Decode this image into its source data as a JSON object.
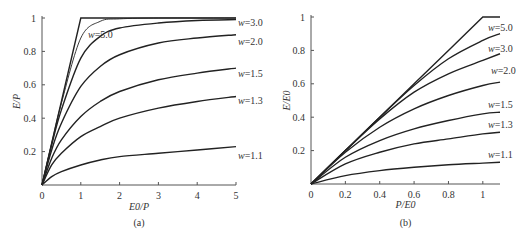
{
  "chart_data": [
    {
      "type": "line",
      "panel": "(a)",
      "xlabel": "E0/P",
      "ylabel": "E/P",
      "xlim": [
        0,
        5
      ],
      "ylim": [
        0,
        1
      ],
      "xticks": [
        "0",
        "1",
        "2",
        "3",
        "4",
        "5"
      ],
      "yticks": [
        "0.2",
        "0.4",
        "0.6",
        "0.8",
        "1"
      ],
      "grid": false,
      "x": [
        0,
        0.25,
        0.5,
        1,
        1.5,
        2,
        3,
        4,
        5
      ],
      "series": [
        {
          "name": "ideal",
          "values": [
            0,
            0.25,
            0.5,
            1.0,
            1.0,
            1.0,
            1.0,
            1.0,
            1.0
          ]
        },
        {
          "name": "w=5.0",
          "values": [
            0,
            0.25,
            0.49,
            0.88,
            0.98,
            0.995,
            1.0,
            1.0,
            1.0
          ]
        },
        {
          "name": "w=3.0",
          "values": [
            0,
            0.24,
            0.45,
            0.76,
            0.89,
            0.94,
            0.97,
            0.985,
            0.99
          ]
        },
        {
          "name": "w=2.0",
          "values": [
            0,
            0.21,
            0.37,
            0.59,
            0.71,
            0.78,
            0.85,
            0.88,
            0.9
          ]
        },
        {
          "name": "w=1.5",
          "values": [
            0,
            0.16,
            0.27,
            0.41,
            0.5,
            0.56,
            0.63,
            0.67,
            0.7
          ]
        },
        {
          "name": "w=1.3",
          "values": [
            0,
            0.12,
            0.19,
            0.29,
            0.35,
            0.4,
            0.46,
            0.5,
            0.53
          ]
        },
        {
          "name": "w=1.1",
          "values": [
            0,
            0.05,
            0.08,
            0.12,
            0.15,
            0.17,
            0.19,
            0.21,
            0.23
          ]
        }
      ],
      "labels": [
        "w=5.0",
        "w=3.0",
        "w=2.0",
        "w=1.5",
        "w=1.3",
        "w=1.1"
      ],
      "caption": "(a)"
    },
    {
      "type": "line",
      "panel": "(b)",
      "xlabel": "P/E0",
      "ylabel": "E/E0",
      "xlim": [
        0,
        1.1
      ],
      "ylim": [
        0,
        1
      ],
      "xticks": [
        "0",
        "0.2",
        "0.4",
        "0.6",
        "0.8",
        "1"
      ],
      "yticks": [
        "0.2",
        "0.4",
        "0.6",
        "0.8",
        "1"
      ],
      "grid": false,
      "x": [
        0,
        0.2,
        0.4,
        0.6,
        0.8,
        1.0,
        1.1
      ],
      "series": [
        {
          "name": "ideal",
          "values": [
            0,
            0.2,
            0.4,
            0.6,
            0.8,
            1.0,
            1.0
          ]
        },
        {
          "name": "w=5.0",
          "values": [
            0,
            0.2,
            0.4,
            0.59,
            0.75,
            0.86,
            0.9
          ]
        },
        {
          "name": "w=3.0",
          "values": [
            0,
            0.2,
            0.39,
            0.55,
            0.66,
            0.74,
            0.78
          ]
        },
        {
          "name": "w=2.0",
          "values": [
            0,
            0.19,
            0.34,
            0.45,
            0.53,
            0.59,
            0.61
          ]
        },
        {
          "name": "w=1.5",
          "values": [
            0,
            0.16,
            0.26,
            0.33,
            0.38,
            0.42,
            0.43
          ]
        },
        {
          "name": "w=1.3",
          "values": [
            0,
            0.12,
            0.19,
            0.24,
            0.27,
            0.3,
            0.31
          ]
        },
        {
          "name": "w=1.1",
          "values": [
            0,
            0.05,
            0.08,
            0.1,
            0.115,
            0.125,
            0.13
          ]
        }
      ],
      "labels": [
        "w=5.0",
        "w=3.0",
        "w=2.0",
        "w=1.5",
        "w=1.3",
        "w=1.1"
      ],
      "caption": "(b)"
    }
  ]
}
